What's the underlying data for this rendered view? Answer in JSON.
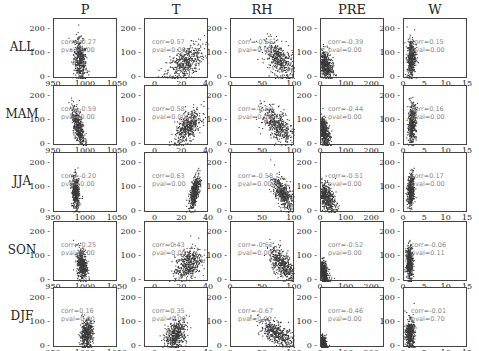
{
  "chart_data": {
    "type": "scatter",
    "title": "",
    "layout": "5x5 scatter matrix",
    "columns": [
      "P",
      "T",
      "RH",
      "PRE",
      "W"
    ],
    "rows": [
      "ALL",
      "MAM",
      "JJA",
      "SON",
      "DJF"
    ],
    "y_axis": {
      "ticks": [
        "0",
        "100",
        "200"
      ],
      "ylim": [
        0,
        250
      ]
    },
    "x_axes": {
      "P": {
        "ticks": [
          "950",
          "1000",
          "1050"
        ],
        "xlim": [
          950,
          1050
        ]
      },
      "T": {
        "ticks": [
          "0",
          "20",
          "40"
        ],
        "xlim": [
          -8,
          40
        ]
      },
      "RH": {
        "ticks": [
          "0",
          "50",
          "100"
        ],
        "xlim": [
          0,
          100
        ]
      },
      "PRE": {
        "ticks": [
          "0",
          "100",
          "200"
        ],
        "xlim": [
          0,
          250
        ]
      },
      "W": {
        "ticks": [
          "0",
          "5",
          "10",
          "15"
        ],
        "xlim": [
          0,
          15
        ]
      }
    },
    "annotations": [
      {
        "row": "ALL",
        "col": "P",
        "corr": "-0.27",
        "pval": "0.00"
      },
      {
        "row": "ALL",
        "col": "T",
        "corr": "0.57",
        "pval": "0.00"
      },
      {
        "row": "ALL",
        "col": "RH",
        "corr": "-0.55",
        "pval": "0.00"
      },
      {
        "row": "ALL",
        "col": "PRE",
        "corr": "-0.39",
        "pval": "0.00"
      },
      {
        "row": "ALL",
        "col": "W",
        "corr": "0.15",
        "pval": "0.00"
      },
      {
        "row": "MAM",
        "col": "P",
        "corr": "-0.59",
        "pval": "0.00"
      },
      {
        "row": "MAM",
        "col": "T",
        "corr": "0.58",
        "pval": "0.00"
      },
      {
        "row": "MAM",
        "col": "RH",
        "corr": "-0.60",
        "pval": "0.00"
      },
      {
        "row": "MAM",
        "col": "PRE",
        "corr": "-0.44",
        "pval": "0.00"
      },
      {
        "row": "MAM",
        "col": "W",
        "corr": "0.16",
        "pval": "0.00"
      },
      {
        "row": "JJA",
        "col": "P",
        "corr": "-0.20",
        "pval": "0.00"
      },
      {
        "row": "JJA",
        "col": "T",
        "corr": "0.63",
        "pval": "0.00"
      },
      {
        "row": "JJA",
        "col": "RH",
        "corr": "-0.58",
        "pval": "0.00"
      },
      {
        "row": "JJA",
        "col": "PRE",
        "corr": "-0.51",
        "pval": "0.00"
      },
      {
        "row": "JJA",
        "col": "W",
        "corr": "0.17",
        "pval": "0.00"
      },
      {
        "row": "SON",
        "col": "P",
        "corr": "-0.25",
        "pval": "0.00"
      },
      {
        "row": "SON",
        "col": "T",
        "corr": "0.43",
        "pval": "0.00"
      },
      {
        "row": "SON",
        "col": "RH",
        "corr": "-0.62",
        "pval": "0.00"
      },
      {
        "row": "SON",
        "col": "PRE",
        "corr": "-0.52",
        "pval": "0.00"
      },
      {
        "row": "SON",
        "col": "W",
        "corr": "-0.06",
        "pval": "0.11"
      },
      {
        "row": "DJF",
        "col": "P",
        "corr": "0.16",
        "pval": "0.00"
      },
      {
        "row": "DJF",
        "col": "T",
        "corr": "0.35",
        "pval": "0.00"
      },
      {
        "row": "DJF",
        "col": "RH",
        "corr": "-0.67",
        "pval": "0.00"
      },
      {
        "row": "DJF",
        "col": "PRE",
        "corr": "-0.46",
        "pval": "0.00"
      },
      {
        "row": "DJF",
        "col": "W",
        "corr": "-0.01",
        "pval": "0.70"
      }
    ],
    "clusters": {
      "P": {
        "ALL": [
          990,
          5,
          80,
          45
        ],
        "MAM": [
          987,
          5,
          85,
          40
        ],
        "JJA": [
          983,
          3,
          85,
          35
        ],
        "SON": [
          993,
          4,
          75,
          35
        ],
        "DJF": [
          1000,
          5,
          60,
          30
        ]
      },
      "T": {
        "ALL": [
          22,
          7,
          70,
          40
        ],
        "MAM": [
          24,
          5,
          80,
          35
        ],
        "JJA": [
          29,
          2,
          90,
          35
        ],
        "SON": [
          24,
          5,
          75,
          35
        ],
        "DJF": [
          15,
          4,
          60,
          30
        ]
      },
      "RH": {
        "ALL": [
          75,
          12,
          80,
          40
        ],
        "MAM": [
          72,
          12,
          85,
          40
        ],
        "JJA": [
          80,
          8,
          85,
          35
        ],
        "SON": [
          80,
          10,
          75,
          35
        ],
        "DJF": [
          72,
          14,
          60,
          30
        ]
      },
      "PRE": {
        "ALL": [
          15,
          15,
          60,
          30
        ],
        "MAM": [
          10,
          12,
          60,
          30
        ],
        "JJA": [
          20,
          18,
          65,
          30
        ],
        "SON": [
          8,
          10,
          40,
          25
        ],
        "DJF": [
          5,
          8,
          20,
          15
        ]
      },
      "W": {
        "ALL": [
          1.6,
          0.5,
          90,
          40
        ],
        "MAM": [
          1.8,
          0.5,
          95,
          40
        ],
        "JJA": [
          1.5,
          0.4,
          95,
          35
        ],
        "SON": [
          1.2,
          0.4,
          80,
          35
        ],
        "DJF": [
          1.3,
          0.5,
          60,
          30
        ]
      }
    },
    "xlabel": "",
    "ylabel": ""
  },
  "labels": {
    "annot_prefix_corr": "corr=",
    "annot_prefix_pval": "pval="
  }
}
